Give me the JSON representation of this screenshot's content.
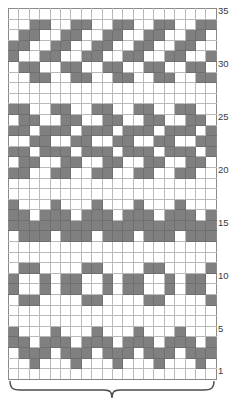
{
  "chart_data": {
    "type": "heatmap",
    "title": "",
    "xlabel": "",
    "ylabel": "",
    "columns": 20,
    "rows": 35,
    "grid_on": true,
    "legend_position": "none",
    "colors": {
      "filled": "#808080",
      "empty": "#ffffff",
      "gridline": "#b9b9b9",
      "border": "#8a8a8a",
      "label_text": "#3a3a3a"
    },
    "row_labels": [
      {
        "row": 35,
        "text": "35"
      },
      {
        "row": 30,
        "text": "30"
      },
      {
        "row": 25,
        "text": "25"
      },
      {
        "row": 20,
        "text": "20"
      },
      {
        "row": 15,
        "text": "15"
      },
      {
        "row": 10,
        "text": "10"
      },
      {
        "row": 5,
        "text": "5"
      },
      {
        "row": 1,
        "text": "1"
      }
    ],
    "repeat_bracket": {
      "label": "",
      "spans_columns": 20
    },
    "cells_top_to_bottom": [
      [
        0,
        0,
        0,
        0,
        0,
        0,
        0,
        0,
        0,
        0,
        0,
        0,
        0,
        0,
        0,
        0,
        0,
        0,
        0,
        0
      ],
      [
        0,
        0,
        1,
        1,
        0,
        0,
        1,
        1,
        0,
        0,
        1,
        1,
        0,
        0,
        1,
        1,
        0,
        0,
        1,
        1
      ],
      [
        0,
        1,
        1,
        0,
        0,
        1,
        1,
        0,
        0,
        1,
        1,
        0,
        0,
        1,
        1,
        0,
        0,
        1,
        1,
        0
      ],
      [
        1,
        1,
        0,
        0,
        1,
        1,
        0,
        0,
        1,
        1,
        0,
        0,
        1,
        1,
        0,
        0,
        1,
        1,
        0,
        0
      ],
      [
        1,
        0,
        0,
        1,
        1,
        0,
        0,
        1,
        1,
        0,
        0,
        1,
        1,
        0,
        0,
        1,
        1,
        0,
        0,
        1
      ],
      [
        0,
        1,
        1,
        0,
        0,
        1,
        1,
        0,
        0,
        1,
        1,
        0,
        0,
        1,
        1,
        0,
        0,
        1,
        1,
        0
      ],
      [
        0,
        0,
        1,
        1,
        0,
        0,
        1,
        1,
        0,
        0,
        1,
        1,
        0,
        0,
        1,
        1,
        0,
        0,
        1,
        1
      ],
      [
        0,
        0,
        0,
        0,
        0,
        0,
        0,
        0,
        0,
        0,
        0,
        0,
        0,
        0,
        0,
        0,
        0,
        0,
        0,
        0
      ],
      [
        0,
        0,
        0,
        0,
        0,
        0,
        0,
        0,
        0,
        0,
        0,
        0,
        0,
        0,
        0,
        0,
        0,
        0,
        0,
        0
      ],
      [
        1,
        1,
        0,
        0,
        1,
        1,
        0,
        0,
        1,
        1,
        0,
        0,
        1,
        1,
        0,
        0,
        1,
        1,
        0,
        0
      ],
      [
        0,
        1,
        1,
        0,
        0,
        1,
        1,
        0,
        0,
        1,
        1,
        0,
        0,
        1,
        1,
        0,
        0,
        1,
        1,
        0
      ],
      [
        1,
        1,
        0,
        1,
        1,
        1,
        0,
        1,
        1,
        1,
        0,
        1,
        1,
        1,
        0,
        1,
        1,
        1,
        0,
        1
      ],
      [
        0,
        0,
        1,
        1,
        0,
        0,
        1,
        1,
        0,
        0,
        1,
        1,
        0,
        0,
        1,
        1,
        0,
        0,
        1,
        1
      ],
      [
        1,
        1,
        0,
        1,
        1,
        1,
        0,
        1,
        1,
        1,
        0,
        1,
        1,
        1,
        0,
        1,
        1,
        1,
        0,
        1
      ],
      [
        0,
        1,
        1,
        0,
        0,
        1,
        1,
        0,
        0,
        1,
        1,
        0,
        0,
        1,
        1,
        0,
        0,
        1,
        1,
        0
      ],
      [
        1,
        1,
        0,
        0,
        1,
        1,
        0,
        0,
        1,
        1,
        0,
        0,
        1,
        1,
        0,
        0,
        1,
        1,
        0,
        0
      ],
      [
        0,
        0,
        0,
        0,
        0,
        0,
        0,
        0,
        0,
        0,
        0,
        0,
        0,
        0,
        0,
        0,
        0,
        0,
        0,
        0
      ],
      [
        0,
        0,
        0,
        0,
        0,
        0,
        0,
        0,
        0,
        0,
        0,
        0,
        0,
        0,
        0,
        0,
        0,
        0,
        0,
        0
      ],
      [
        1,
        0,
        0,
        0,
        1,
        0,
        0,
        0,
        1,
        0,
        0,
        0,
        1,
        0,
        0,
        0,
        1,
        0,
        0,
        0
      ],
      [
        1,
        1,
        0,
        1,
        1,
        1,
        0,
        1,
        1,
        1,
        0,
        1,
        1,
        1,
        0,
        1,
        1,
        1,
        0,
        1
      ],
      [
        1,
        1,
        1,
        1,
        1,
        1,
        1,
        1,
        1,
        1,
        1,
        1,
        1,
        1,
        1,
        1,
        1,
        1,
        1,
        1
      ],
      [
        0,
        1,
        1,
        1,
        0,
        1,
        1,
        1,
        0,
        1,
        1,
        1,
        0,
        1,
        1,
        1,
        0,
        1,
        1,
        1
      ],
      [
        0,
        0,
        0,
        0,
        0,
        0,
        0,
        0,
        0,
        0,
        0,
        0,
        0,
        0,
        0,
        0,
        0,
        0,
        0,
        0
      ],
      [
        0,
        0,
        0,
        0,
        0,
        0,
        0,
        0,
        0,
        0,
        0,
        0,
        0,
        0,
        0,
        0,
        0,
        0,
        0,
        0
      ],
      [
        0,
        1,
        1,
        0,
        0,
        0,
        0,
        1,
        1,
        0,
        0,
        0,
        0,
        1,
        1,
        0,
        0,
        0,
        0,
        1
      ],
      [
        1,
        0,
        0,
        1,
        0,
        1,
        1,
        0,
        0,
        1,
        0,
        1,
        1,
        0,
        0,
        1,
        0,
        1,
        1,
        0
      ],
      [
        1,
        0,
        0,
        1,
        0,
        1,
        1,
        0,
        0,
        1,
        0,
        1,
        1,
        0,
        0,
        1,
        0,
        1,
        1,
        0
      ],
      [
        0,
        1,
        1,
        0,
        0,
        0,
        0,
        1,
        1,
        0,
        0,
        0,
        0,
        1,
        1,
        0,
        0,
        0,
        0,
        1
      ],
      [
        0,
        0,
        0,
        0,
        0,
        0,
        0,
        0,
        0,
        0,
        0,
        0,
        0,
        0,
        0,
        0,
        0,
        0,
        0,
        0
      ],
      [
        0,
        0,
        0,
        0,
        0,
        0,
        0,
        0,
        0,
        0,
        0,
        0,
        0,
        0,
        0,
        0,
        0,
        0,
        0,
        0
      ],
      [
        1,
        0,
        0,
        0,
        1,
        0,
        0,
        0,
        1,
        0,
        0,
        0,
        1,
        0,
        0,
        0,
        1,
        0,
        0,
        0
      ],
      [
        1,
        1,
        0,
        1,
        1,
        1,
        0,
        1,
        1,
        1,
        0,
        1,
        1,
        1,
        0,
        1,
        1,
        1,
        0,
        1
      ],
      [
        0,
        1,
        1,
        1,
        0,
        1,
        1,
        1,
        0,
        1,
        1,
        1,
        0,
        1,
        1,
        1,
        0,
        1,
        1,
        1
      ],
      [
        0,
        0,
        1,
        0,
        0,
        0,
        1,
        0,
        0,
        0,
        1,
        0,
        0,
        0,
        1,
        0,
        0,
        0,
        1,
        0
      ],
      [
        0,
        0,
        0,
        0,
        0,
        0,
        0,
        0,
        0,
        0,
        0,
        0,
        0,
        0,
        0,
        0,
        0,
        0,
        0,
        0
      ]
    ]
  }
}
